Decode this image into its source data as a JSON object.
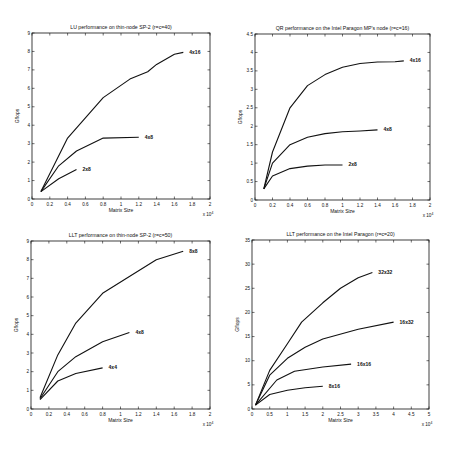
{
  "chart_data": [
    {
      "type": "line",
      "title": "LU performance on thin-node SP-2 (r=c=40)",
      "xlabel": "Matrix Size",
      "ylabel": "Gflops",
      "x_exponent": "x 10^4",
      "xlim": [
        0,
        2
      ],
      "ylim": [
        0,
        9
      ],
      "xticks": [
        "0",
        "0.2",
        "0.4",
        "0.6",
        "0.8",
        "1",
        "1.2",
        "1.4",
        "1.6",
        "1.8",
        "2"
      ],
      "yticks": [
        "0",
        "1",
        "2",
        "3",
        "4",
        "5",
        "6",
        "7",
        "8",
        "9"
      ],
      "grid": false,
      "box": {
        "x0": 32,
        "y0": 33,
        "x1": 210,
        "y1": 199
      },
      "series": [
        {
          "name": "2x8",
          "x": [
            0.1,
            0.3,
            0.5
          ],
          "y": [
            0.4,
            1.1,
            1.6
          ]
        },
        {
          "name": "4x8",
          "x": [
            0.1,
            0.3,
            0.5,
            0.8,
            1.2
          ],
          "y": [
            0.4,
            1.8,
            2.6,
            3.3,
            3.35
          ]
        },
        {
          "name": "4x16",
          "x": [
            0.1,
            0.4,
            0.8,
            1.1,
            1.3,
            1.4,
            1.6,
            1.7
          ],
          "y": [
            0.4,
            3.3,
            5.5,
            6.5,
            6.9,
            7.3,
            7.85,
            7.95
          ]
        }
      ]
    },
    {
      "type": "line",
      "title": "QR performance on the Intel Paragon MP's node (r=c=16)",
      "xlabel": "Matrix Size",
      "ylabel": "Gflops",
      "x_exponent": "x 10^4",
      "xlim": [
        0,
        2
      ],
      "ylim": [
        0,
        4.5
      ],
      "xticks": [
        "0",
        "0.2",
        "0.4",
        "0.6",
        "0.8",
        "1",
        "1.2",
        "1.4",
        "1.6",
        "1.8",
        "2"
      ],
      "yticks": [
        "0",
        "0.5",
        "1",
        "1.5",
        "2",
        "2.5",
        "3",
        "3.5",
        "4",
        "4.5"
      ],
      "grid": false,
      "box": {
        "x0": 255,
        "y0": 34,
        "x1": 430,
        "y1": 200
      },
      "series": [
        {
          "name": "2x8",
          "x": [
            0.1,
            0.2,
            0.4,
            0.6,
            0.8,
            1.0
          ],
          "y": [
            0.3,
            0.65,
            0.85,
            0.92,
            0.95,
            0.95
          ]
        },
        {
          "name": "4x8",
          "x": [
            0.1,
            0.2,
            0.4,
            0.6,
            0.8,
            1.0,
            1.2,
            1.4
          ],
          "y": [
            0.3,
            1.0,
            1.5,
            1.7,
            1.8,
            1.85,
            1.87,
            1.9
          ]
        },
        {
          "name": "4x16",
          "x": [
            0.1,
            0.2,
            0.4,
            0.6,
            0.8,
            1.0,
            1.2,
            1.4,
            1.6,
            1.7
          ],
          "y": [
            0.3,
            1.3,
            2.5,
            3.1,
            3.4,
            3.6,
            3.7,
            3.74,
            3.75,
            3.77
          ]
        }
      ]
    },
    {
      "type": "line",
      "title": "LLT performance on thin-node SP-2 (r=c=50)",
      "xlabel": "Matrix Size",
      "ylabel": "Gflops",
      "x_exponent": "x 10^4",
      "xlim": [
        0,
        2
      ],
      "ylim": [
        0,
        9
      ],
      "xticks": [
        "0",
        "0.2",
        "0.4",
        "0.6",
        "0.8",
        "1",
        "1.2",
        "1.4",
        "1.6",
        "1.8",
        "2"
      ],
      "yticks": [
        "0",
        "1",
        "2",
        "3",
        "4",
        "5",
        "6",
        "7",
        "8",
        "9"
      ],
      "grid": false,
      "box": {
        "x0": 31,
        "y0": 241,
        "x1": 210,
        "y1": 409
      },
      "series": [
        {
          "name": "4x4",
          "x": [
            0.1,
            0.3,
            0.5,
            0.8
          ],
          "y": [
            0.5,
            1.5,
            1.9,
            2.2
          ]
        },
        {
          "name": "4x8",
          "x": [
            0.1,
            0.3,
            0.5,
            0.8,
            1.1
          ],
          "y": [
            0.55,
            2.0,
            2.8,
            3.6,
            4.1
          ]
        },
        {
          "name": "8x8",
          "x": [
            0.1,
            0.3,
            0.5,
            0.8,
            1.1,
            1.4,
            1.7
          ],
          "y": [
            0.6,
            2.9,
            4.6,
            6.2,
            7.1,
            8.0,
            8.45
          ]
        }
      ]
    },
    {
      "type": "line",
      "title": "LLT performance on the Intel Paragon (r=c=20)",
      "xlabel": "Matrix Size",
      "ylabel": "Gflops",
      "x_exponent": "x 10^4",
      "xlim": [
        0,
        5
      ],
      "ylim": [
        0,
        35
      ],
      "xticks": [
        "0",
        "0.5",
        "1",
        "1.5",
        "2",
        "2.5",
        "3",
        "3.5",
        "4",
        "4.5",
        "5"
      ],
      "yticks": [
        "0",
        "5",
        "10",
        "15",
        "20",
        "25",
        "30",
        "35"
      ],
      "grid": false,
      "box": {
        "x0": 252,
        "y0": 240,
        "x1": 429,
        "y1": 409
      },
      "series": [
        {
          "name": "8x16",
          "x": [
            0.1,
            0.5,
            1.0,
            1.5,
            2.0
          ],
          "y": [
            0.8,
            3.0,
            3.9,
            4.4,
            4.7
          ]
        },
        {
          "name": "16x16",
          "x": [
            0.1,
            0.7,
            1.2,
            2.0,
            2.8
          ],
          "y": [
            0.8,
            6.0,
            7.8,
            8.7,
            9.3
          ]
        },
        {
          "name": "16x32",
          "x": [
            0.1,
            0.5,
            1.0,
            1.5,
            2.0,
            3.0,
            4.0
          ],
          "y": [
            0.8,
            7.0,
            10.5,
            12.8,
            14.5,
            16.5,
            18.0
          ]
        },
        {
          "name": "32x32",
          "x": [
            0.1,
            0.5,
            1.0,
            1.4,
            2.0,
            2.5,
            3.0,
            3.4
          ],
          "y": [
            0.8,
            8.0,
            13.5,
            18.0,
            22.0,
            25.0,
            27.2,
            28.3
          ]
        }
      ]
    }
  ]
}
